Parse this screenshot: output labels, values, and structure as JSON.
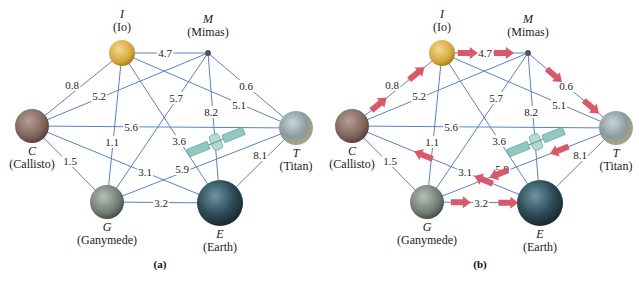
{
  "figure": {
    "colors": {
      "edge": "#5b82c4",
      "arrow": "#d9586a",
      "satellite": "#8fc9c2"
    },
    "nodes": [
      {
        "id": "I",
        "letter": "I",
        "name": "(Io)",
        "x": 122,
        "y": 53,
        "r": 13,
        "fill": "#d8b24a",
        "label_pos": "above"
      },
      {
        "id": "M",
        "letter": "M",
        "name": "(Mimas)",
        "x": 208,
        "y": 53,
        "r": 3,
        "fill": "#555555",
        "label_pos": "above"
      },
      {
        "id": "C",
        "letter": "C",
        "name": "(Callisto)",
        "x": 32,
        "y": 126,
        "r": 17,
        "fill": "#8a7266",
        "label_pos": "below"
      },
      {
        "id": "T",
        "letter": "T",
        "name": "(Titan)",
        "x": 296,
        "y": 128,
        "r": 17,
        "fill": "#8fa1a8",
        "label_pos": "below"
      },
      {
        "id": "G",
        "letter": "G",
        "name": "(Ganymede)",
        "x": 107,
        "y": 202,
        "r": 17,
        "fill": "#6f7b73",
        "label_pos": "below"
      },
      {
        "id": "E",
        "letter": "E",
        "name": "(Earth)",
        "x": 220,
        "y": 203,
        "r": 23,
        "fill": "#2f4a55",
        "label_pos": "below"
      }
    ],
    "edges": [
      {
        "from": "I",
        "to": "M",
        "weight": "4.7",
        "lx": 165,
        "ly": 57
      },
      {
        "from": "C",
        "to": "I",
        "weight": "0.8",
        "lx": 72,
        "ly": 89
      },
      {
        "from": "C",
        "to": "M",
        "weight": "5.2",
        "lx": 99,
        "ly": 100
      },
      {
        "from": "I",
        "to": "T",
        "weight": "5.1",
        "lx": 239,
        "ly": 109
      },
      {
        "from": "M",
        "to": "T",
        "weight": "0.6",
        "lx": 246,
        "ly": 90
      },
      {
        "from": "M",
        "to": "G",
        "weight": "5.7",
        "lx": 176,
        "ly": 102
      },
      {
        "from": "M",
        "to": "E",
        "weight": "8.2",
        "lx": 211,
        "ly": 116
      },
      {
        "from": "C",
        "to": "T",
        "weight": "5.6",
        "lx": 131,
        "ly": 131
      },
      {
        "from": "I",
        "to": "G",
        "weight": "1.1",
        "lx": 112,
        "ly": 146
      },
      {
        "from": "I",
        "to": "E",
        "weight": "3.6",
        "lx": 179,
        "ly": 145
      },
      {
        "from": "C",
        "to": "G",
        "weight": "1.5",
        "lx": 70,
        "ly": 165
      },
      {
        "from": "C",
        "to": "E",
        "weight": "3.1",
        "lx": 145,
        "ly": 176
      },
      {
        "from": "G",
        "to": "T",
        "weight": "5.9",
        "lx": 182,
        "ly": 173
      },
      {
        "from": "T",
        "to": "E",
        "weight": "8.1",
        "lx": 260,
        "ly": 159
      },
      {
        "from": "G",
        "to": "E",
        "weight": "3.2",
        "lx": 161,
        "ly": 207
      }
    ],
    "panels": [
      {
        "id": "a",
        "label": "(a)",
        "offset_x": 0
      },
      {
        "id": "b",
        "label": "(b)",
        "offset_x": 320
      }
    ],
    "panel_b_arrows": [
      {
        "edge": "C-I",
        "direction": "C->I"
      },
      {
        "edge": "I-M",
        "direction": "I->M"
      },
      {
        "edge": "M-T",
        "direction": "M->T"
      },
      {
        "edge": "T-G",
        "direction": "T->G"
      },
      {
        "edge": "E-C",
        "direction": "E->C"
      },
      {
        "edge": "G-E",
        "direction": "G->E"
      }
    ]
  }
}
